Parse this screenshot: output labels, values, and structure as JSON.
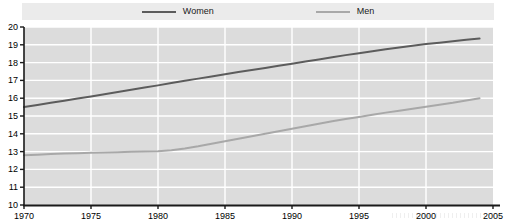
{
  "chart_data": {
    "type": "line",
    "title": "",
    "subtitle": "",
    "xlabel": "",
    "ylabel": "",
    "xlim": [
      1970,
      2005
    ],
    "ylim": [
      10,
      20
    ],
    "xticks": [
      1970,
      1975,
      1980,
      1985,
      1990,
      1995,
      2000,
      2005
    ],
    "yticks": [
      10,
      11,
      12,
      13,
      14,
      15,
      16,
      17,
      18,
      19,
      20
    ],
    "grid": "horizontal and vertical white gridlines on gray panel",
    "legend_position": "top-center",
    "x": [
      1970,
      1971,
      1972,
      1973,
      1974,
      1975,
      1976,
      1977,
      1978,
      1979,
      1980,
      1981,
      1982,
      1983,
      1984,
      1985,
      1986,
      1987,
      1988,
      1989,
      1990,
      1991,
      1992,
      1993,
      1994,
      1995,
      1996,
      1997,
      1998,
      1999,
      2000,
      2001,
      2002,
      2003,
      2004
    ],
    "series": [
      {
        "name": "Women",
        "color": "#5c5c5c",
        "values": [
          15.5,
          15.62,
          15.74,
          15.86,
          15.98,
          16.1,
          16.22,
          16.35,
          16.48,
          16.6,
          16.72,
          16.85,
          16.98,
          17.1,
          17.22,
          17.35,
          17.47,
          17.58,
          17.7,
          17.82,
          17.94,
          18.06,
          18.18,
          18.3,
          18.42,
          18.53,
          18.64,
          18.75,
          18.85,
          18.95,
          19.04,
          19.12,
          19.2,
          19.28,
          19.35
        ]
      },
      {
        "name": "Men",
        "color": "#a8a8a8",
        "values": [
          12.8,
          12.83,
          12.86,
          12.89,
          12.91,
          12.93,
          12.95,
          12.97,
          12.99,
          13.0,
          13.02,
          13.08,
          13.18,
          13.3,
          13.44,
          13.58,
          13.72,
          13.86,
          14.0,
          14.14,
          14.28,
          14.42,
          14.56,
          14.7,
          14.83,
          14.95,
          15.07,
          15.19,
          15.3,
          15.41,
          15.52,
          15.63,
          15.74,
          15.87,
          16.0
        ]
      }
    ]
  },
  "legend": {
    "entries": [
      {
        "label": "Women",
        "color": "#5c5c5c",
        "icon": "line-swatch-icon"
      },
      {
        "label": "Men",
        "color": "#a8a8a8",
        "icon": "line-swatch-icon"
      }
    ]
  },
  "axes": {
    "y_tick_labels": [
      "20",
      "19",
      "18",
      "17",
      "16",
      "15",
      "14",
      "13",
      "12",
      "11",
      "10"
    ],
    "x_tick_labels": [
      "1970",
      "1975",
      "1980",
      "1985",
      "1990",
      "1995",
      "2000",
      "2005"
    ]
  },
  "style": {
    "panel_background": "#dcdcdc",
    "gridline_color": "#ffffff",
    "axis_color": "#1a1a1a",
    "legend_background": "#ebebeb",
    "page_background": "#ffffff"
  }
}
